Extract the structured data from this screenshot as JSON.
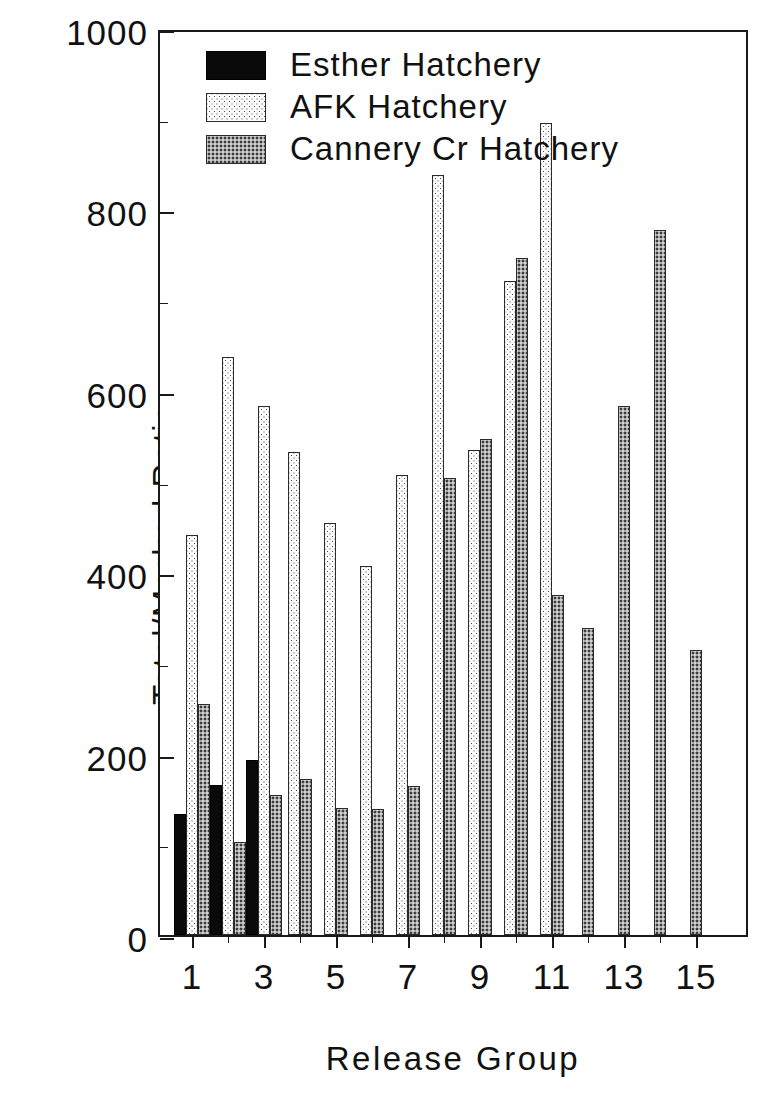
{
  "chart_data": {
    "type": "bar",
    "title": "",
    "xlabel": "Release Group",
    "ylabel": "Total/Marked Ratio",
    "ylim": [
      0,
      1000
    ],
    "ytick_labels": [
      "0",
      "200",
      "400",
      "600",
      "800",
      "1000"
    ],
    "yticks": [
      0,
      200,
      400,
      600,
      800,
      1000
    ],
    "yticks_minor": [
      100,
      300,
      500,
      700,
      900
    ],
    "grid": false,
    "legend_position": "top-left",
    "categories": [
      "1",
      "2",
      "3",
      "4",
      "5",
      "6",
      "7",
      "8",
      "9",
      "10",
      "11",
      "12",
      "13",
      "14",
      "15"
    ],
    "xtick_labels": [
      "1",
      "3",
      "5",
      "7",
      "9",
      "11",
      "13",
      "15"
    ],
    "xticks": [
      1,
      3,
      5,
      7,
      9,
      11,
      13,
      15
    ],
    "series": [
      {
        "name": "Esther Hatchery",
        "pattern": "solid-black",
        "color": "#0a0a0a",
        "values": [
          133,
          165,
          193,
          null,
          null,
          null,
          null,
          null,
          null,
          null,
          null,
          null,
          null,
          null,
          null
        ]
      },
      {
        "name": "AFK Hatchery",
        "pattern": "light-dotted",
        "color": "#fdfdfd",
        "values": [
          441,
          637,
          583,
          533,
          454,
          407,
          507,
          838,
          535,
          721,
          895,
          null,
          null,
          null,
          null
        ]
      },
      {
        "name": "Cannery Cr Hatchery",
        "pattern": "gray-dotted",
        "color": "#a5a5a5",
        "values": [
          255,
          103,
          154,
          172,
          140,
          139,
          164,
          504,
          547,
          746,
          375,
          338,
          583,
          777,
          314
        ]
      }
    ]
  },
  "legend": {
    "items": [
      {
        "label": "Esther Hatchery",
        "swatch": "solid-black"
      },
      {
        "label": "AFK Hatchery",
        "swatch": "light-dotted"
      },
      {
        "label": "Cannery Cr Hatchery",
        "swatch": "gray-dotted"
      }
    ]
  }
}
